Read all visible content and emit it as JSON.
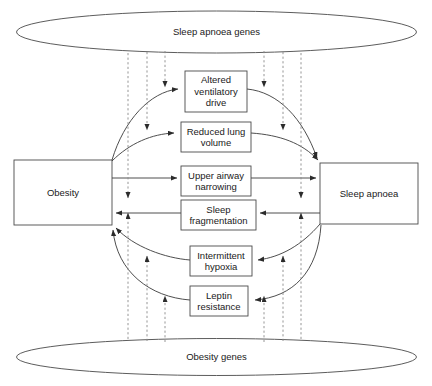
{
  "diagram": {
    "type": "flow-diagram",
    "canvas": {
      "width": 432,
      "height": 386
    },
    "stroke_color": "#3a3a3a",
    "dashed_stroke_color": "#777777",
    "text_color": "#1a1a1a",
    "background": "#ffffff"
  },
  "ellipses": [
    {
      "id": "sleep-apnoea-genes",
      "label": "Sleep apnoea genes",
      "cx": 216.5,
      "cy": 32,
      "rx": 200,
      "ry": 21
    },
    {
      "id": "obesity-genes",
      "label": "Obesity genes",
      "cx": 216.5,
      "cy": 357,
      "rx": 200,
      "ry": 18.5
    }
  ],
  "end_boxes": [
    {
      "id": "obesity",
      "label": "Obesity",
      "x": 14,
      "y": 160,
      "w": 98,
      "h": 65
    },
    {
      "id": "sleep-apnoea",
      "label": "Sleep apnoea",
      "x": 320,
      "y": 163,
      "w": 98,
      "h": 61
    }
  ],
  "mediator_boxes": [
    {
      "id": "altered-ventilatory-drive",
      "label": "Altered\nventilatory\ndrive",
      "x": 185,
      "y": 71,
      "w": 62,
      "h": 41
    },
    {
      "id": "reduced-lung-volume",
      "label": "Reduced lung\nvolume",
      "x": 181,
      "y": 122,
      "w": 70,
      "h": 30
    },
    {
      "id": "upper-airway-narrowing",
      "label": "Upper airway\nnarrowing",
      "x": 181,
      "y": 166,
      "w": 70,
      "h": 30
    },
    {
      "id": "sleep-fragmentation",
      "label": "Sleep\nfragmentation",
      "x": 181,
      "y": 200,
      "w": 75,
      "h": 30
    },
    {
      "id": "intermittent-hypoxia",
      "label": "Intermittent\nhypoxia",
      "x": 190,
      "y": 246,
      "w": 62,
      "h": 30
    },
    {
      "id": "leptin-resistance",
      "label": "Leptin\nresistance",
      "x": 190,
      "y": 286,
      "w": 58,
      "h": 30
    }
  ],
  "dashed_connectors": {
    "top_gene_lines_x": [
      128,
      147,
      165,
      264,
      283,
      301
    ],
    "bottom_gene_lines_x": [
      128,
      147,
      165,
      264,
      283,
      301
    ],
    "top_direction": "down",
    "bottom_direction": "up"
  },
  "solid_connectors": [
    {
      "from": "obesity",
      "to": "altered-ventilatory-drive",
      "style": "curved"
    },
    {
      "from": "altered-ventilatory-drive",
      "to": "sleep-apnoea",
      "style": "curved"
    },
    {
      "from": "obesity",
      "to": "reduced-lung-volume",
      "style": "curved"
    },
    {
      "from": "reduced-lung-volume",
      "to": "sleep-apnoea",
      "style": "curved"
    },
    {
      "from": "obesity",
      "to": "upper-airway-narrowing",
      "style": "straight"
    },
    {
      "from": "upper-airway-narrowing",
      "to": "sleep-apnoea",
      "style": "straight"
    },
    {
      "from": "sleep-apnoea",
      "to": "sleep-fragmentation",
      "style": "straight"
    },
    {
      "from": "sleep-fragmentation",
      "to": "obesity",
      "style": "straight"
    },
    {
      "from": "sleep-apnoea",
      "to": "intermittent-hypoxia",
      "style": "curved"
    },
    {
      "from": "intermittent-hypoxia",
      "to": "obesity",
      "style": "curved"
    },
    {
      "from": "sleep-apnoea",
      "to": "leptin-resistance",
      "style": "curved"
    },
    {
      "from": "leptin-resistance",
      "to": "obesity",
      "style": "curved"
    }
  ]
}
